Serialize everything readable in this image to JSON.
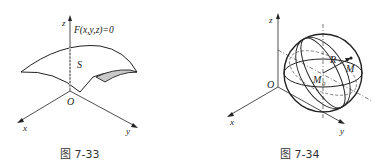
{
  "figures": [
    {
      "id": "7-33",
      "caption": "图 7-33",
      "labels": {
        "equation": "F(x,y,z)=0",
        "surface": "S",
        "origin": "O",
        "x_axis": "x",
        "y_axis": "y",
        "z_axis": "z"
      }
    },
    {
      "id": "7-34",
      "caption": "图 7-34",
      "labels": {
        "origin": "O",
        "x_axis": "x",
        "y_axis": "y",
        "z_axis": "z",
        "radius": "R",
        "center": "M",
        "center_sub": "0",
        "point": "M"
      }
    }
  ],
  "colors": {
    "stroke": "#222222",
    "shaded_patch": "#c8c8c8"
  }
}
